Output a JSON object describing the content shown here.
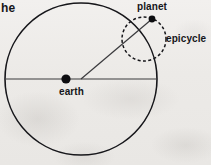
{
  "figure": {
    "kind": "ptolemaic-epicycle-diagram",
    "page_text_fragment": "he",
    "labels": {
      "planet": "planet",
      "epicycle": "epicycle",
      "earth": "earth"
    },
    "colors": {
      "ink": "#16161a",
      "line": "#3a3a3d",
      "paper": "#eceae7"
    },
    "geometry": {
      "deferent": {
        "cx": 81,
        "cy": 79,
        "r": 76,
        "stroke_width": 1.6,
        "style": "solid"
      },
      "epicycle": {
        "cx": 144,
        "cy": 39,
        "r": 22,
        "stroke_width": 1.5,
        "style": "dashed",
        "dash": "3 2.4"
      },
      "earth_dot": {
        "cx": 66,
        "cy": 79,
        "r": 4.6
      },
      "planet_dot": {
        "cx": 152,
        "cy": 19,
        "r": 3.4
      },
      "horizontal_line": {
        "x1": 6,
        "y1": 79,
        "x2": 156,
        "y2": 79,
        "stroke_width": 1.2
      },
      "radius_line": {
        "x1": 81,
        "y1": 79,
        "x2": 152,
        "y2": 19,
        "stroke_width": 1.2
      }
    }
  }
}
